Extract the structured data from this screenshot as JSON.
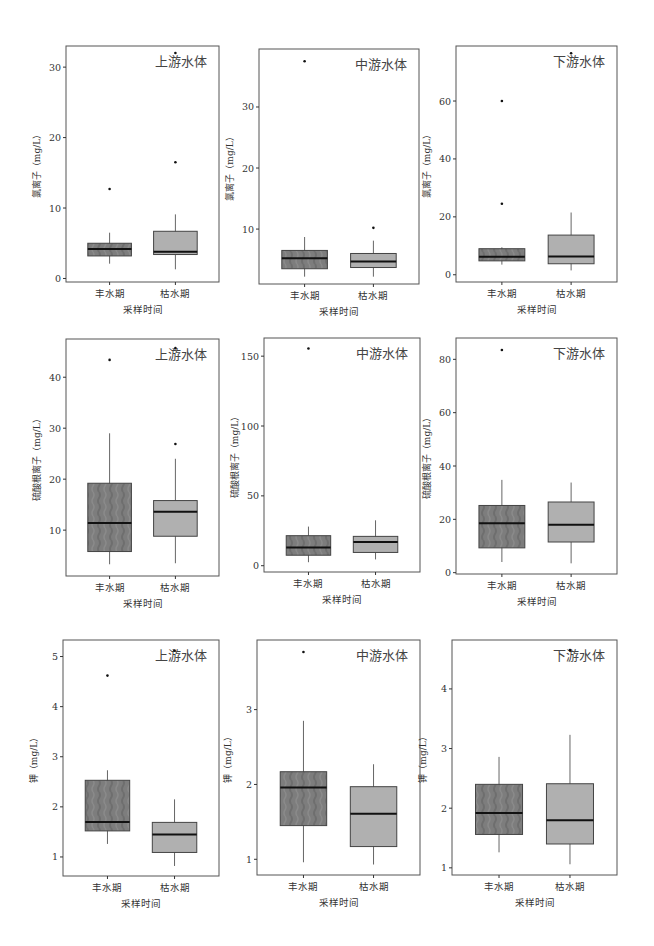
{
  "figure": {
    "x_axis_label": "采样时间",
    "categories": [
      "丰水期",
      "枯水期"
    ],
    "colors": {
      "wet_season_box": "#7a7a7a",
      "dry_season_box": "#b0b0b0",
      "frame": "#555555",
      "median": "#111111",
      "whisker": "#666666",
      "text": "#333333"
    }
  },
  "chart_data": [
    {
      "type": "boxplot",
      "row": 0,
      "col": 0,
      "title": "上游水体",
      "ylabel": "氯离子（mg/L）",
      "xlabel": "采样时间",
      "categories": [
        "丰水期",
        "枯水期"
      ],
      "yticks": [
        0,
        10,
        20,
        30
      ],
      "ylim": [
        -0.5,
        33
      ],
      "series": [
        {
          "name": "丰水期",
          "min": 2.1,
          "q1": 3.2,
          "median": 4.2,
          "q3": 5.0,
          "max": 6.5,
          "outliers": [
            12.7
          ]
        },
        {
          "name": "枯水期",
          "min": 1.3,
          "q1": 3.4,
          "median": 3.8,
          "q3": 6.7,
          "max": 9.1,
          "outliers": [
            16.5,
            32.0
          ]
        }
      ]
    },
    {
      "type": "boxplot",
      "row": 0,
      "col": 1,
      "title": "中游水体",
      "ylabel": "氯离子（mg/L）",
      "xlabel": "采样时间",
      "categories": [
        "丰水期",
        "枯水期"
      ],
      "yticks": [
        10,
        20,
        30
      ],
      "ylim": [
        1.0,
        39.5
      ],
      "series": [
        {
          "name": "丰水期",
          "min": 2.2,
          "q1": 3.5,
          "median": 5.2,
          "q3": 6.5,
          "max": 8.7,
          "outliers": [
            37.5
          ]
        },
        {
          "name": "枯水期",
          "min": 2.2,
          "q1": 3.7,
          "median": 4.7,
          "q3": 6.0,
          "max": 8.1,
          "outliers": [
            10.2
          ]
        }
      ]
    },
    {
      "type": "boxplot",
      "row": 0,
      "col": 2,
      "title": "下游水体",
      "ylabel": "氯离子（mg/L）",
      "xlabel": "采样时间",
      "categories": [
        "丰水期",
        "枯水期"
      ],
      "yticks": [
        0,
        20,
        40,
        60
      ],
      "ylim": [
        -2.5,
        79
      ],
      "series": [
        {
          "name": "丰水期",
          "min": 3.5,
          "q1": 4.8,
          "median": 6.2,
          "q3": 9.0,
          "max": 9.5,
          "outliers": [
            24.5,
            60.0
          ]
        },
        {
          "name": "枯水期",
          "min": 1.5,
          "q1": 3.8,
          "median": 6.3,
          "q3": 13.7,
          "max": 21.5,
          "outliers": [
            76.5
          ]
        }
      ]
    },
    {
      "type": "boxplot",
      "row": 1,
      "col": 0,
      "title": "上游水体",
      "ylabel": "硫酸根离子（mg/L）",
      "xlabel": "采样时间",
      "categories": [
        "丰水期",
        "枯水期"
      ],
      "yticks": [
        10,
        20,
        30,
        40
      ],
      "ylim": [
        1.0,
        47.5
      ],
      "series": [
        {
          "name": "丰水期",
          "min": 3.3,
          "q1": 5.8,
          "median": 11.4,
          "q3": 19.2,
          "max": 29.0,
          "outliers": [
            43.4
          ]
        },
        {
          "name": "枯水期",
          "min": 3.5,
          "q1": 8.8,
          "median": 13.6,
          "q3": 15.8,
          "max": 24.0,
          "outliers": [
            26.9,
            45.7
          ]
        }
      ]
    },
    {
      "type": "boxplot",
      "row": 1,
      "col": 1,
      "title": "中游水体",
      "ylabel": "硫酸根离子（mg/L）",
      "xlabel": "采样时间",
      "categories": [
        "丰水期",
        "枯水期"
      ],
      "yticks": [
        0,
        50,
        100,
        150
      ],
      "ylim": [
        -4.5,
        163
      ],
      "series": [
        {
          "name": "丰水期",
          "min": 2.5,
          "q1": 7.5,
          "median": 13.0,
          "q3": 21.5,
          "max": 28.0,
          "outliers": [
            155.5
          ]
        },
        {
          "name": "枯水期",
          "min": 4.5,
          "q1": 9.5,
          "median": 17.0,
          "q3": 21.0,
          "max": 32.5,
          "outliers": []
        }
      ]
    },
    {
      "type": "boxplot",
      "row": 1,
      "col": 2,
      "title": "下游水体",
      "ylabel": "硫酸根离子（mg/L）",
      "xlabel": "采样时间",
      "categories": [
        "丰水期",
        "枯水期"
      ],
      "yticks": [
        0,
        20,
        40,
        60,
        80
      ],
      "ylim": [
        -0.5,
        88
      ],
      "series": [
        {
          "name": "丰水期",
          "min": 4.0,
          "q1": 9.3,
          "median": 18.5,
          "q3": 25.2,
          "max": 34.8,
          "outliers": [
            83.5
          ]
        },
        {
          "name": "枯水期",
          "min": 3.5,
          "q1": 11.5,
          "median": 18.0,
          "q3": 26.5,
          "max": 33.8,
          "outliers": []
        }
      ]
    },
    {
      "type": "boxplot",
      "row": 2,
      "col": 0,
      "title": "上游水体",
      "ylabel": "钾（mg/L）",
      "xlabel": "采样时间",
      "categories": [
        "丰水期",
        "枯水期"
      ],
      "yticks": [
        1,
        2,
        3,
        4,
        5
      ],
      "ylim": [
        0.62,
        5.33
      ],
      "series": [
        {
          "name": "丰水期",
          "min": 1.26,
          "q1": 1.52,
          "median": 1.7,
          "q3": 2.53,
          "max": 2.73,
          "outliers": [
            4.62
          ]
        },
        {
          "name": "枯水期",
          "min": 0.82,
          "q1": 1.09,
          "median": 1.45,
          "q3": 1.69,
          "max": 2.15,
          "outliers": [
            5.12
          ]
        }
      ]
    },
    {
      "type": "boxplot",
      "row": 2,
      "col": 1,
      "title": "中游水体",
      "ylabel": "钾（mg/L）",
      "xlabel": "采样时间",
      "categories": [
        "丰水期",
        "枯水期"
      ],
      "yticks": [
        1,
        2,
        3
      ],
      "ylim": [
        0.79,
        3.93
      ],
      "series": [
        {
          "name": "丰水期",
          "min": 0.96,
          "q1": 1.45,
          "median": 1.96,
          "q3": 2.17,
          "max": 2.85,
          "outliers": [
            3.77
          ]
        },
        {
          "name": "枯水期",
          "min": 0.93,
          "q1": 1.17,
          "median": 1.61,
          "q3": 1.97,
          "max": 2.27,
          "outliers": []
        }
      ]
    },
    {
      "type": "boxplot",
      "row": 2,
      "col": 2,
      "title": "下游水体",
      "ylabel": "钾（mg/L）",
      "xlabel": "采样时间",
      "categories": [
        "丰水期",
        "枯水期"
      ],
      "yticks": [
        1,
        2,
        3,
        4
      ],
      "ylim": [
        0.88,
        4.82
      ],
      "series": [
        {
          "name": "丰水期",
          "min": 1.26,
          "q1": 1.56,
          "median": 1.92,
          "q3": 2.4,
          "max": 2.86,
          "outliers": []
        },
        {
          "name": "枯水期",
          "min": 1.06,
          "q1": 1.4,
          "median": 1.8,
          "q3": 2.41,
          "max": 3.23,
          "outliers": [
            4.65
          ]
        }
      ]
    }
  ]
}
